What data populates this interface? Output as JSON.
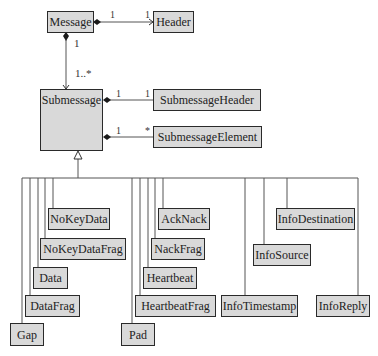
{
  "diagram": {
    "type": "UML class diagram",
    "classes": {
      "message": "Message",
      "header": "Header",
      "submessage": "Submessage",
      "submessage_header": "SubmessageHeader",
      "submessage_element": "SubmessageElement",
      "no_key_data": "NoKeyData",
      "no_key_data_frag": "NoKeyDataFrag",
      "data": "Data",
      "data_frag": "DataFrag",
      "gap": "Gap",
      "ack_nack": "AckNack",
      "nack_frag": "NackFrag",
      "heartbeat": "Heartbeat",
      "heartbeat_frag": "HeartbeatFrag",
      "pad": "Pad",
      "info_destination": "InfoDestination",
      "info_source": "InfoSource",
      "info_timestamp": "InfoTimestamp",
      "info_reply": "InfoReply"
    },
    "multiplicities": {
      "message_header_src": "1",
      "message_header_dst": "1",
      "message_submessage_src": "1",
      "message_submessage_dst": "1..*",
      "sub_header_src": "1",
      "sub_header_dst": "1",
      "sub_element_src": "1",
      "sub_element_dst": "*"
    },
    "colors": {
      "box_fill": "#d9d9d9",
      "box_border": "#2a2a2a",
      "line": "#555555"
    }
  }
}
